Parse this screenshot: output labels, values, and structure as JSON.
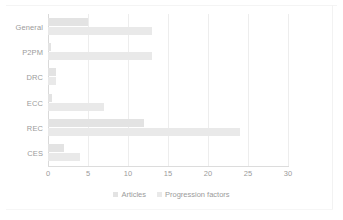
{
  "chart_data": {
    "type": "bar",
    "orientation": "horizontal",
    "title": "",
    "xlabel": "",
    "ylabel": "",
    "categories": [
      "General",
      "P2PM",
      "DRC",
      "ECC",
      "REC",
      "CES"
    ],
    "series": [
      {
        "name": "Articles",
        "color": "#e3e3e3",
        "values": [
          5,
          0.4,
          1,
          0.5,
          12,
          2
        ]
      },
      {
        "name": "Progression factors",
        "color": "#e9e9e9",
        "values": [
          13,
          13,
          1,
          7,
          24,
          4
        ]
      }
    ],
    "xlim": [
      0,
      30
    ],
    "xticks": [
      0,
      5,
      10,
      15,
      20,
      25,
      30
    ],
    "xtick_labels": [
      "0",
      "5",
      "10",
      "15",
      "20",
      "25",
      "30"
    ],
    "grid": true,
    "grid_axis": "x",
    "legend_position": "bottom"
  },
  "legend": {
    "items": [
      {
        "label": "Articles",
        "color": "#e3e3e3"
      },
      {
        "label": "Progression factors",
        "color": "#e9e9e9"
      }
    ]
  }
}
